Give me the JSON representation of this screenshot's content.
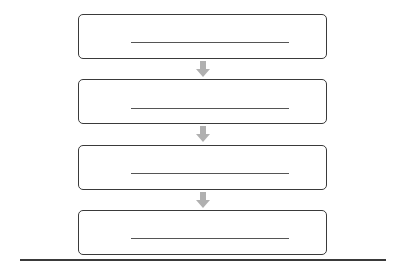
{
  "diagram": {
    "type": "vertical-flowchart",
    "steps": [
      {
        "label": "",
        "blank_line": true
      },
      {
        "label": "",
        "blank_line": true
      },
      {
        "label": "",
        "blank_line": true
      },
      {
        "label": "",
        "blank_line": true
      }
    ],
    "arrows": [
      {
        "from": 0,
        "to": 1,
        "icon": "down-arrow-icon"
      },
      {
        "from": 1,
        "to": 2,
        "icon": "down-arrow-icon"
      },
      {
        "from": 2,
        "to": 3,
        "icon": "down-arrow-icon"
      }
    ],
    "colors": {
      "border": "#3a3a3a",
      "arrow": "#b0b0b0",
      "blank_line": "#555555"
    }
  }
}
